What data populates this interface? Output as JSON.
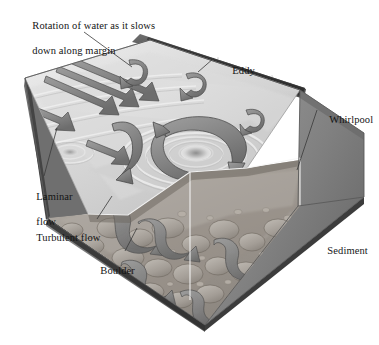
{
  "figure": {
    "kind": "block-diagram",
    "background_color": "#ffffff",
    "palette": {
      "water_light": "#e9e9e9",
      "water_mid": "#c9c9c9",
      "water_shadow": "#9a9a9a",
      "arrow_fill": "#8e8e8e",
      "arrow_dark": "#6b6b6b",
      "arrow_outline": "#3a3a3a",
      "bank_dark": "#4a4a4a",
      "bed_rock": "#a7a29b",
      "bed_rock_shadow": "#7d7872",
      "side_face": "#8a8a8a",
      "side_face_dark": "#5e5e5e",
      "base_edge": "#2e2e2e",
      "leader_line": "#3a3a3a",
      "text": "#141414"
    }
  },
  "labels": [
    {
      "id": "rotation-of-water",
      "name": "label-rotation-of-water",
      "line1": "Rotation of water as it slows",
      "line2": "down along margin",
      "x": 16,
      "y": 7,
      "leader": {
        "x1": 84,
        "y1": 32,
        "x2": 132,
        "y2": 67
      }
    },
    {
      "id": "eddy",
      "name": "label-eddy",
      "line1": "Eddy",
      "line2": "",
      "x": 216,
      "y": 52,
      "leader": {
        "x1": 214,
        "y1": 58,
        "x2": 198,
        "y2": 72
      }
    },
    {
      "id": "whirlpool",
      "name": "label-whirlpool",
      "line1": "Whirlpool",
      "line2": "",
      "x": 313,
      "y": 101,
      "leader": {
        "x1": 317,
        "y1": 110,
        "x2": 297,
        "y2": 170
      }
    },
    {
      "id": "laminar-flow",
      "name": "label-laminar-flow",
      "line1": "Laminar",
      "line2": "flow",
      "x": 20,
      "y": 178,
      "leader": {
        "x1": 44,
        "y1": 176,
        "x2": 57,
        "y2": 128
      }
    },
    {
      "id": "turbulent-flow",
      "name": "label-turbulent-flow",
      "line1": "Turbulent flow",
      "line2": "",
      "x": 20,
      "y": 219,
      "leader": {
        "x1": 97,
        "y1": 219,
        "x2": 112,
        "y2": 196
      }
    },
    {
      "id": "boulder",
      "name": "label-boulder",
      "line1": "Boulder",
      "line2": "",
      "x": 84,
      "y": 252,
      "leader": {
        "x1": 125,
        "y1": 251,
        "x2": 137,
        "y2": 228
      }
    },
    {
      "id": "sediment",
      "name": "label-sediment",
      "line1": "Sediment",
      "line2": "",
      "x": 311,
      "y": 232,
      "leader": null
    }
  ],
  "features": {
    "laminar_arrows": {
      "name": "laminar-flow-arrows",
      "count": 4,
      "description": "Long straight parallel arrows on the upstream water surface pointing downstream toward lower right"
    },
    "eddy_arrows": {
      "name": "eddy-arrows",
      "count": 4,
      "description": "Small hooked curled arrows near the far bank margin where flow slows and rotates"
    },
    "central_vortex": {
      "name": "central-vortex-arrow",
      "description": "Large counterclockwise circular arrow encircling a depressed ripple-ringed vortex in midchannel"
    },
    "whirlpool_funnel": {
      "name": "whirlpool-funnel",
      "description": "Dark funnel-shaped depression with concentric surface rings near the right bank"
    },
    "turbulent_arrows": {
      "name": "turbulent-flow-arrows",
      "count": 5,
      "description": "Twisting ribbon arrows weaving among boulders in the cut-away bed"
    },
    "boulders": {
      "name": "boulder-bed",
      "description": "Rounded cobbles and boulders exposed on the cut-away channel floor"
    },
    "ripples": {
      "name": "surface-ripples",
      "description": "Concentric light ripple rings radiating from vortices across the water surface"
    }
  }
}
